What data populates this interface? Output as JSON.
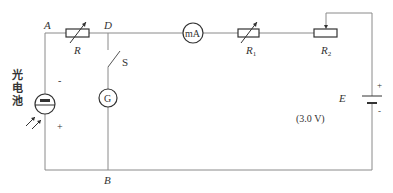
{
  "nodes": {
    "A": "A",
    "D": "D",
    "B": "B"
  },
  "components": {
    "R": {
      "label": "R",
      "type": "rheostat"
    },
    "mA": {
      "label": "mA",
      "type": "milliammeter"
    },
    "R1": {
      "label": "R",
      "sub": "1",
      "type": "rheostat"
    },
    "R2": {
      "label": "R",
      "sub": "2",
      "type": "potentiometer"
    },
    "S": {
      "label": "S",
      "type": "switch"
    },
    "G": {
      "label": "G",
      "type": "galvanometer"
    },
    "E": {
      "label": "E",
      "value": "(3.0 V)",
      "plus": "+",
      "minus": "-",
      "type": "battery"
    },
    "photocell": {
      "label_chars": [
        "光",
        "电",
        "池"
      ],
      "plus": "+",
      "minus": "-",
      "type": "photocell"
    }
  }
}
